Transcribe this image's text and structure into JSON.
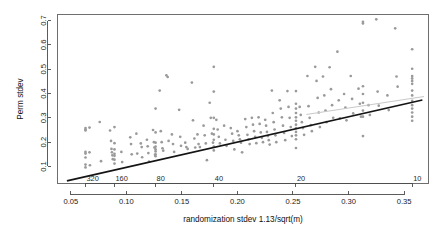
{
  "chart_data": {
    "type": "scatter",
    "title": "",
    "xlabel": "randomization stdev 1.13/sqrt(m)",
    "ylabel": "Perm stdev",
    "xlim": [
      0.038,
      0.372
    ],
    "ylim": [
      0.03,
      0.725
    ],
    "grid": false,
    "legend": null,
    "x_ticks": [
      "0.05",
      "0.10",
      "0.15",
      "0.20",
      "0.25",
      "0.30",
      "0.35"
    ],
    "x_tick_values": [
      0.05,
      0.1,
      0.15,
      0.2,
      0.25,
      0.3,
      0.35
    ],
    "y_ticks": [
      "0.1",
      "0.2",
      "0.3",
      "0.4",
      "0.5",
      "0.6",
      "0.7"
    ],
    "y_tick_values": [
      0.1,
      0.2,
      0.3,
      0.4,
      0.5,
      0.6,
      0.7
    ],
    "secondary_axis": {
      "position": "inside-bottom",
      "label": "",
      "ticks": [
        "320",
        "160",
        "80",
        "40",
        "20",
        "10"
      ],
      "tick_m_values": [
        320,
        160,
        80,
        40,
        20,
        10
      ],
      "tick_x_values": [
        0.0632,
        0.0893,
        0.1263,
        0.1787,
        0.2527,
        0.3573
      ]
    },
    "fit_line": {
      "name": "least squares fit",
      "color": "#141414",
      "x_start": 0.0465,
      "y_start": 0.0405,
      "x_end": 0.3665,
      "y_end": 0.3735
    },
    "reference_line": {
      "name": "faint identity reference",
      "color": "#c9c9c9",
      "x_start": 0.262,
      "y_start": 0.314,
      "x_end": 0.368,
      "y_end": 0.388
    },
    "point_color": "#9a9a9a",
    "point_radius": 1.35,
    "series": [
      {
        "name": "Perm stdev vs randomization stdev",
        "x": [
          0.0632,
          0.0632,
          0.0632,
          0.0632,
          0.0632,
          0.0632,
          0.0632,
          0.0632,
          0.0668,
          0.0668,
          0.0672,
          0.076,
          0.0772,
          0.0853,
          0.0862,
          0.0866,
          0.087,
          0.0874,
          0.0878,
          0.0893,
          0.0893,
          0.0893,
          0.0893,
          0.0893,
          0.0893,
          0.0893,
          0.0955,
          0.0962,
          0.1035,
          0.1042,
          0.1048,
          0.109,
          0.1098,
          0.113,
          0.1138,
          0.1142,
          0.1185,
          0.1192,
          0.1198,
          0.1204,
          0.124,
          0.1248,
          0.1252,
          0.1258,
          0.1263,
          0.1263,
          0.1263,
          0.1263,
          0.1263,
          0.1263,
          0.1263,
          0.1263,
          0.13,
          0.131,
          0.1318,
          0.1325,
          0.1332,
          0.136,
          0.1372,
          0.138,
          0.141,
          0.142,
          0.143,
          0.1475,
          0.1485,
          0.1492,
          0.153,
          0.154,
          0.1552,
          0.159,
          0.16,
          0.1612,
          0.162,
          0.164,
          0.165,
          0.1662,
          0.1695,
          0.1705,
          0.1715,
          0.1725,
          0.175,
          0.176,
          0.177,
          0.178,
          0.1787,
          0.1787,
          0.1787,
          0.1787,
          0.1787,
          0.1787,
          0.1787,
          0.1787,
          0.181,
          0.1822,
          0.1832,
          0.1842,
          0.188,
          0.1892,
          0.1902,
          0.194,
          0.1952,
          0.1962,
          0.1972,
          0.2,
          0.2012,
          0.2022,
          0.2032,
          0.2042,
          0.207,
          0.208,
          0.209,
          0.21,
          0.211,
          0.213,
          0.214,
          0.215,
          0.216,
          0.217,
          0.219,
          0.22,
          0.221,
          0.222,
          0.223,
          0.225,
          0.2258,
          0.2266,
          0.2274,
          0.2282,
          0.229,
          0.231,
          0.2318,
          0.2326,
          0.2334,
          0.2342,
          0.235,
          0.238,
          0.239,
          0.24,
          0.241,
          0.242,
          0.243,
          0.245,
          0.246,
          0.247,
          0.248,
          0.249,
          0.2527,
          0.2527,
          0.2527,
          0.2527,
          0.2527,
          0.2527,
          0.2527,
          0.2527,
          0.2527,
          0.2527,
          0.2527,
          0.2527,
          0.256,
          0.257,
          0.258,
          0.259,
          0.26,
          0.263,
          0.264,
          0.265,
          0.266,
          0.267,
          0.27,
          0.2712,
          0.2722,
          0.2732,
          0.2742,
          0.277,
          0.2782,
          0.2792,
          0.2802,
          0.283,
          0.2842,
          0.2852,
          0.2862,
          0.29,
          0.2912,
          0.2922,
          0.296,
          0.2972,
          0.2982,
          0.302,
          0.3032,
          0.3042,
          0.309,
          0.3102,
          0.3112,
          0.313,
          0.313,
          0.313,
          0.313,
          0.313,
          0.313,
          0.313,
          0.313,
          0.318,
          0.3192,
          0.325,
          0.3262,
          0.3272,
          0.335,
          0.3362,
          0.342,
          0.3432,
          0.3442,
          0.3573,
          0.3573,
          0.3573,
          0.3573,
          0.3573,
          0.3573,
          0.3573,
          0.3573,
          0.3573,
          0.3573,
          0.3573,
          0.3573,
          0.3573,
          0.3573
        ],
        "y": [
          0.252,
          0.248,
          0.258,
          0.16,
          0.153,
          0.137,
          0.108,
          0.096,
          0.26,
          0.158,
          0.105,
          0.283,
          0.122,
          0.248,
          0.205,
          0.172,
          0.158,
          0.146,
          0.13,
          0.262,
          0.196,
          0.17,
          0.152,
          0.144,
          0.128,
          0.112,
          0.16,
          0.118,
          0.22,
          0.192,
          0.15,
          0.235,
          0.153,
          0.195,
          0.18,
          0.138,
          0.21,
          0.183,
          0.155,
          0.12,
          0.25,
          0.2,
          0.178,
          0.148,
          0.338,
          0.24,
          0.198,
          0.182,
          0.17,
          0.162,
          0.15,
          0.142,
          0.412,
          0.245,
          0.2,
          0.175,
          0.165,
          0.475,
          0.468,
          0.205,
          0.232,
          0.192,
          0.16,
          0.333,
          0.222,
          0.185,
          0.198,
          0.18,
          0.172,
          0.445,
          0.29,
          0.215,
          0.178,
          0.232,
          0.192,
          0.18,
          0.268,
          0.228,
          0.195,
          0.126,
          0.362,
          0.3,
          0.235,
          0.198,
          0.51,
          0.408,
          0.3,
          0.255,
          0.232,
          0.21,
          0.182,
          0.166,
          0.292,
          0.252,
          0.222,
          0.195,
          0.268,
          0.21,
          0.185,
          0.258,
          0.235,
          0.205,
          0.17,
          0.245,
          0.228,
          0.212,
          0.198,
          0.158,
          0.295,
          0.262,
          0.23,
          0.212,
          0.192,
          0.3,
          0.272,
          0.245,
          0.222,
          0.196,
          0.302,
          0.275,
          0.24,
          0.218,
          0.2,
          0.292,
          0.268,
          0.242,
          0.225,
          0.208,
          0.19,
          0.412,
          0.32,
          0.282,
          0.252,
          0.228,
          0.2,
          0.372,
          0.338,
          0.302,
          0.268,
          0.238,
          0.208,
          0.41,
          0.345,
          0.3,
          0.262,
          0.225,
          0.41,
          0.358,
          0.338,
          0.32,
          0.302,
          0.288,
          0.272,
          0.258,
          0.242,
          0.228,
          0.212,
          0.176,
          0.345,
          0.312,
          0.282,
          0.258,
          0.23,
          0.472,
          0.348,
          0.3,
          0.27,
          0.245,
          0.51,
          0.452,
          0.382,
          0.322,
          0.262,
          0.47,
          0.392,
          0.33,
          0.282,
          0.508,
          0.418,
          0.352,
          0.3,
          0.572,
          0.372,
          0.298,
          0.398,
          0.342,
          0.29,
          0.472,
          0.378,
          0.318,
          0.42,
          0.358,
          0.305,
          0.695,
          0.688,
          0.43,
          0.398,
          0.362,
          0.33,
          0.305,
          0.225,
          0.352,
          0.312,
          0.705,
          0.408,
          0.35,
          0.392,
          0.332,
          0.668,
          0.47,
          0.428,
          0.582,
          0.502,
          0.472,
          0.462,
          0.452,
          0.44,
          0.412,
          0.392,
          0.37,
          0.352,
          0.338,
          0.322,
          0.305,
          0.288
        ]
      }
    ]
  }
}
